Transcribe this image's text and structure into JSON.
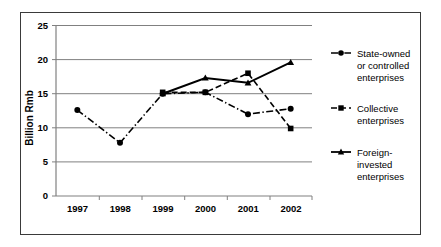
{
  "chart_data": {
    "type": "line",
    "title": "",
    "xlabel": "",
    "ylabel": "Billion Rmb",
    "categories": [
      "1997",
      "1998",
      "1999",
      "2000",
      "2001",
      "2002"
    ],
    "x": [
      1997,
      1998,
      1999,
      2000,
      2001,
      2002
    ],
    "ylim": [
      0,
      25
    ],
    "yticks": [
      0,
      5,
      10,
      15,
      20,
      25
    ],
    "ytick_labels": [
      "0",
      "5",
      "10",
      "15",
      "20",
      "25"
    ],
    "grid": true,
    "legend_position": "right",
    "series": [
      {
        "name": "State-owned or controlled enterprises",
        "legend_label_lines": [
          "State-owned",
          "or controlled",
          "enterprises"
        ],
        "values": [
          12.6,
          7.8,
          15.0,
          15.2,
          12.0,
          12.8
        ],
        "line_style": "dash-dot",
        "marker": "circle",
        "color": "#000000"
      },
      {
        "name": "Collective enterprises",
        "legend_label_lines": [
          "Collective",
          "enterprises"
        ],
        "values": [
          null,
          null,
          15.2,
          15.2,
          18.0,
          9.9
        ],
        "line_style": "dashed",
        "marker": "square",
        "color": "#000000"
      },
      {
        "name": "Foreign-invested enterprises",
        "legend_label_lines": [
          "Foreign-",
          "invested",
          "enterprises"
        ],
        "values": [
          null,
          null,
          15.0,
          17.3,
          16.6,
          19.6
        ],
        "line_style": "solid",
        "marker": "triangle",
        "color": "#000000"
      }
    ]
  },
  "axis": {
    "y_title": "Billion Rmb",
    "y_ticks": [
      "25",
      "20",
      "15",
      "10",
      "5",
      "0"
    ],
    "x_ticks": [
      "1997",
      "1998",
      "1999",
      "2000",
      "2001",
      "2002"
    ]
  },
  "legend": {
    "entries": [
      {
        "id": "state-owned",
        "lines": [
          "State-owned",
          "or controlled",
          "enterprises"
        ]
      },
      {
        "id": "collective",
        "lines": [
          "Collective",
          "enterprises"
        ]
      },
      {
        "id": "foreign-invested",
        "lines": [
          "Foreign-",
          "invested",
          "enterprises"
        ]
      }
    ]
  },
  "style": {
    "frame_color": "#3a3a3a",
    "grid_color": "#808080",
    "series_color": "#000000",
    "background": "#ffffff"
  }
}
